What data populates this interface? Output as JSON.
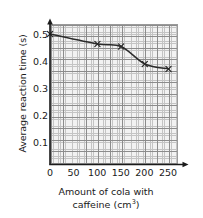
{
  "chart_data": {
    "type": "line",
    "title": "",
    "xlabel_line1": "Amount of cola with",
    "xlabel_line2_pre": "caffeine (cm",
    "xlabel_line2_sup": "3",
    "xlabel_line2_post": ")",
    "xlabel": "Amount of cola with caffeine (cm3)",
    "ylabel": "Average reaction time (s)",
    "x": [
      0,
      100,
      150,
      200,
      250
    ],
    "values": [
      0.52,
      0.48,
      0.47,
      0.4,
      0.38
    ],
    "series": [
      {
        "name": "Average reaction time",
        "x": [
          0,
          100,
          150,
          200,
          250
        ],
        "values": [
          0.52,
          0.48,
          0.47,
          0.4,
          0.38
        ]
      }
    ],
    "marker": "x",
    "line_color": "#2b2b2b",
    "marker_color": "#2b2b2b",
    "grid": true,
    "grid_color": "#c4c4c4",
    "grid_major_color": "#8c8c8c",
    "plot_background": "#f2f2f2",
    "axis_color": "#1a1a1a",
    "legend": "none",
    "xlim": [
      0,
      270
    ],
    "ylim": [
      0,
      0.56
    ],
    "xticks": [
      "0",
      "50",
      "100",
      "150",
      "200",
      "250"
    ],
    "xtick_values": [
      0,
      50,
      100,
      150,
      200,
      250
    ],
    "yticks": [
      "0.1",
      "0.2",
      "0.3",
      "0.4",
      "0.5"
    ],
    "ytick_values": [
      0.1,
      0.2,
      0.3,
      0.4,
      0.5
    ]
  }
}
